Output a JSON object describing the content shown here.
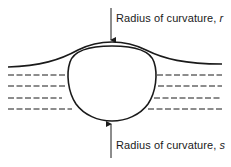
{
  "diagram": {
    "type": "bubble-at-liquid-surface",
    "labels": {
      "top": {
        "text": "Radius of curvature, ",
        "variable": "r"
      },
      "bottom": {
        "text": "Radius of curvature, ",
        "variable": "s"
      }
    },
    "colors": {
      "stroke": "#1a1a1a",
      "background": "#ffffff"
    },
    "dashed_rows": 4
  }
}
